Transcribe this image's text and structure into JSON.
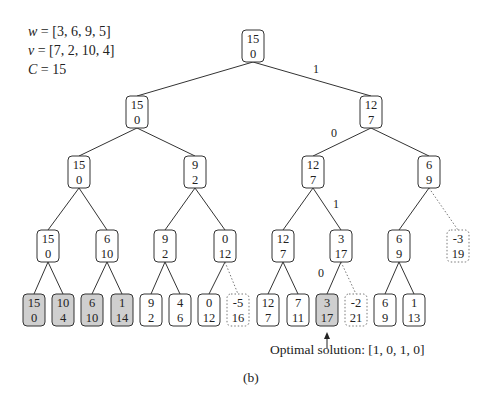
{
  "parameters": {
    "w_label": "w",
    "w_value": "= [3, 6, 9, 5]",
    "v_label": "v",
    "v_value": "= [7, 2, 10, 4]",
    "C_label": "C",
    "C_value": "= 15"
  },
  "tree": {
    "box": {
      "width": 22,
      "height": 32,
      "radius": 4
    },
    "colors": {
      "stroke": "#333333",
      "fill": "#ffffff",
      "optimal_fill": "#cfcfcf",
      "infeasible_stroke": "#777777"
    },
    "nodes": [
      {
        "id": "n0",
        "top": "15",
        "bottom": "0",
        "cx": 253,
        "cy": 46,
        "style": "normal"
      },
      {
        "id": "n1",
        "top": "15",
        "bottom": "0",
        "cx": 137,
        "cy": 112,
        "style": "normal"
      },
      {
        "id": "n2",
        "top": "12",
        "bottom": "7",
        "cx": 371,
        "cy": 112,
        "style": "normal"
      },
      {
        "id": "n3",
        "top": "15",
        "bottom": "0",
        "cx": 79,
        "cy": 172,
        "style": "normal"
      },
      {
        "id": "n4",
        "top": "9",
        "bottom": "2",
        "cx": 195,
        "cy": 172,
        "style": "normal"
      },
      {
        "id": "n5",
        "top": "12",
        "bottom": "7",
        "cx": 313,
        "cy": 172,
        "style": "normal"
      },
      {
        "id": "n6",
        "top": "6",
        "bottom": "9",
        "cx": 429,
        "cy": 172,
        "style": "normal"
      },
      {
        "id": "n7",
        "top": "15",
        "bottom": "0",
        "cx": 48,
        "cy": 246,
        "style": "normal"
      },
      {
        "id": "n8",
        "top": "6",
        "bottom": "10",
        "cx": 107,
        "cy": 246,
        "style": "normal"
      },
      {
        "id": "n9",
        "top": "9",
        "bottom": "2",
        "cx": 165,
        "cy": 246,
        "style": "normal"
      },
      {
        "id": "n10",
        "top": "0",
        "bottom": "12",
        "cx": 225,
        "cy": 246,
        "style": "normal"
      },
      {
        "id": "n11",
        "top": "12",
        "bottom": "7",
        "cx": 283,
        "cy": 246,
        "style": "normal"
      },
      {
        "id": "n12",
        "top": "3",
        "bottom": "17",
        "cx": 341,
        "cy": 246,
        "style": "normal"
      },
      {
        "id": "n13",
        "top": "6",
        "bottom": "9",
        "cx": 399,
        "cy": 246,
        "style": "normal"
      },
      {
        "id": "n14",
        "top": "-3",
        "bottom": "19",
        "cx": 458,
        "cy": 246,
        "style": "infeasible"
      },
      {
        "id": "n15",
        "top": "15",
        "bottom": "0",
        "cx": 34,
        "cy": 310,
        "style": "shaded"
      },
      {
        "id": "n16",
        "top": "10",
        "bottom": "4",
        "cx": 63,
        "cy": 310,
        "style": "shaded"
      },
      {
        "id": "n17",
        "top": "6",
        "bottom": "10",
        "cx": 92,
        "cy": 310,
        "style": "shaded"
      },
      {
        "id": "n18",
        "top": "1",
        "bottom": "14",
        "cx": 122,
        "cy": 310,
        "style": "shaded"
      },
      {
        "id": "n19",
        "top": "9",
        "bottom": "2",
        "cx": 151,
        "cy": 310,
        "style": "normal"
      },
      {
        "id": "n20",
        "top": "4",
        "bottom": "6",
        "cx": 180,
        "cy": 310,
        "style": "normal"
      },
      {
        "id": "n21",
        "top": "0",
        "bottom": "12",
        "cx": 209,
        "cy": 310,
        "style": "normal"
      },
      {
        "id": "n22",
        "top": "-5",
        "bottom": "16",
        "cx": 238,
        "cy": 310,
        "style": "infeasible"
      },
      {
        "id": "n23",
        "top": "12",
        "bottom": "7",
        "cx": 268,
        "cy": 310,
        "style": "normal"
      },
      {
        "id": "n24",
        "top": "7",
        "bottom": "11",
        "cx": 298,
        "cy": 310,
        "style": "normal"
      },
      {
        "id": "n25",
        "top": "3",
        "bottom": "17",
        "cx": 327,
        "cy": 310,
        "style": "shaded"
      },
      {
        "id": "n26",
        "top": "-2",
        "bottom": "21",
        "cx": 356,
        "cy": 310,
        "style": "infeasible"
      },
      {
        "id": "n27",
        "top": "6",
        "bottom": "9",
        "cx": 385,
        "cy": 310,
        "style": "normal"
      },
      {
        "id": "n28",
        "top": "1",
        "bottom": "13",
        "cx": 414,
        "cy": 310,
        "style": "normal"
      }
    ],
    "edges": [
      {
        "from": "n0",
        "to": "n1",
        "style": "solid"
      },
      {
        "from": "n0",
        "to": "n2",
        "style": "solid",
        "label": "1",
        "lx": 316,
        "ly": 73
      },
      {
        "from": "n1",
        "to": "n3",
        "style": "solid"
      },
      {
        "from": "n1",
        "to": "n4",
        "style": "solid"
      },
      {
        "from": "n2",
        "to": "n5",
        "style": "solid",
        "label": "0",
        "lx": 334,
        "ly": 137
      },
      {
        "from": "n2",
        "to": "n6",
        "style": "solid"
      },
      {
        "from": "n3",
        "to": "n7",
        "style": "solid"
      },
      {
        "from": "n3",
        "to": "n8",
        "style": "solid"
      },
      {
        "from": "n4",
        "to": "n9",
        "style": "solid"
      },
      {
        "from": "n4",
        "to": "n10",
        "style": "solid"
      },
      {
        "from": "n5",
        "to": "n11",
        "style": "solid"
      },
      {
        "from": "n5",
        "to": "n12",
        "style": "solid",
        "label": "1",
        "lx": 336,
        "ly": 208
      },
      {
        "from": "n6",
        "to": "n13",
        "style": "solid"
      },
      {
        "from": "n6",
        "to": "n14",
        "style": "dotted"
      },
      {
        "from": "n7",
        "to": "n15",
        "style": "solid"
      },
      {
        "from": "n7",
        "to": "n16",
        "style": "solid"
      },
      {
        "from": "n8",
        "to": "n17",
        "style": "solid"
      },
      {
        "from": "n8",
        "to": "n18",
        "style": "solid"
      },
      {
        "from": "n9",
        "to": "n19",
        "style": "solid"
      },
      {
        "from": "n9",
        "to": "n20",
        "style": "solid"
      },
      {
        "from": "n10",
        "to": "n21",
        "style": "solid"
      },
      {
        "from": "n10",
        "to": "n22",
        "style": "dotted"
      },
      {
        "from": "n11",
        "to": "n23",
        "style": "solid"
      },
      {
        "from": "n11",
        "to": "n24",
        "style": "solid"
      },
      {
        "from": "n12",
        "to": "n25",
        "style": "solid",
        "label": "0",
        "lx": 321,
        "ly": 277
      },
      {
        "from": "n12",
        "to": "n26",
        "style": "dotted"
      },
      {
        "from": "n13",
        "to": "n27",
        "style": "solid"
      },
      {
        "from": "n13",
        "to": "n28",
        "style": "solid"
      }
    ]
  },
  "annotation": {
    "arrow_target": "n25",
    "text": "Optimal solution: [1, 0, 1, 0]"
  },
  "caption": "(b)"
}
